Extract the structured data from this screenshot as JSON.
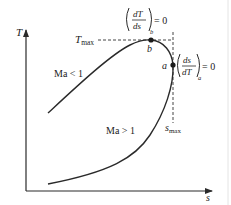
{
  "diagram": {
    "type": "T-s diagram (Fanno line)",
    "colors": {
      "line": "#2a2a2a",
      "dash": "#444444",
      "point": "#1a1a1a",
      "edge": "#dcdcdc"
    },
    "axes": {
      "y_label": "T",
      "x_label": "s"
    },
    "labels": {
      "t_max": {
        "main": "T",
        "sub": "max"
      },
      "s_max": {
        "main": "s",
        "sub": "max"
      },
      "subsonic": "Ma < 1",
      "supersonic": "Ma > 1",
      "point_a": "a",
      "point_b": "b",
      "cond_b": {
        "num": "dT",
        "den": "ds",
        "sub": "b",
        "rhs": "= 0"
      },
      "cond_a": {
        "num": "ds",
        "den": "dT",
        "sub": "a",
        "rhs": "= 0"
      }
    },
    "points": [
      {
        "name": "b",
        "x": 151,
        "y": 40
      },
      {
        "name": "a",
        "x": 173,
        "y": 65
      }
    ]
  }
}
